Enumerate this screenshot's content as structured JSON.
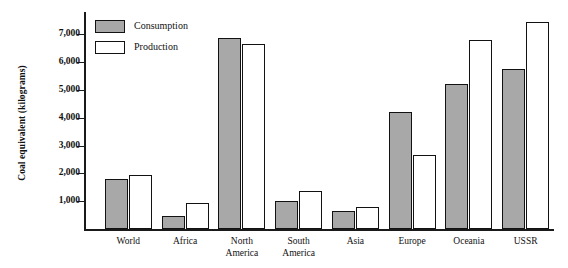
{
  "chart_data": {
    "type": "bar",
    "title": "",
    "subtitle": "",
    "xlabel": "",
    "ylabel": "Coal equivalent (kilograms)",
    "categories": [
      "World",
      "Africa",
      "North\nAmerica",
      "South\nAmerica",
      "Asia",
      "Europe",
      "Oceania",
      "USSR"
    ],
    "series": [
      {
        "name": "Consumption",
        "color": "#a8a8a8",
        "values": [
          1800,
          450,
          6850,
          1000,
          650,
          4200,
          5200,
          5750
        ]
      },
      {
        "name": "Production",
        "color": "#ffffff",
        "values": [
          1950,
          950,
          6650,
          1350,
          800,
          2650,
          6800,
          7450
        ]
      }
    ],
    "ylim": [
      0,
      7800
    ],
    "yticks": [
      1000,
      2000,
      3000,
      4000,
      5000,
      6000,
      7000
    ],
    "ytick_labels": [
      "1,000",
      "2,000",
      "3,000",
      "4,000",
      "5,000",
      "6,000",
      "7,000"
    ],
    "grid": false,
    "legend_position": "top-left",
    "legend_entries": [
      "Consumption",
      "Production"
    ]
  },
  "legend": {
    "items": [
      {
        "label": "Consumption",
        "swatch": "filled-gray-swatch"
      },
      {
        "label": "Production",
        "swatch": "empty-white-swatch"
      }
    ]
  },
  "axes": {
    "y_title": "Coal equivalent (kilograms)"
  }
}
